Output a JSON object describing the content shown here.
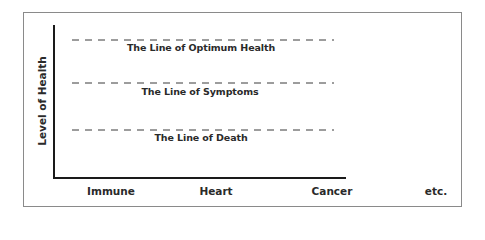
{
  "diagram": {
    "y_axis_label": "Level of Health",
    "lines": [
      {
        "label": "The Line of Optimum Health",
        "style": "dashed"
      },
      {
        "label": "The Line of Symptoms",
        "style": "dashed"
      },
      {
        "label": "The Line of Death",
        "style": "dashed"
      }
    ],
    "categories": [
      "Immune",
      "Heart",
      "Cancer",
      "etc."
    ],
    "colors": {
      "axis": "#1a1a1a",
      "text": "#2a2a2a",
      "frame": "#8a8a8a"
    }
  }
}
